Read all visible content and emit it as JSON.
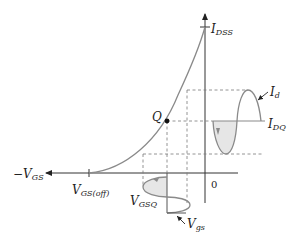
{
  "diagram": {
    "colors": {
      "axis": "#333333",
      "curve": "#8a8a8a",
      "dashed": "#7a7a7a",
      "fill": "#e6e6e6",
      "point": "#111111",
      "text": "#222222"
    },
    "labels": {
      "idss_main": "I",
      "idss_sub": "DSS",
      "neg_vgs_prefix": "−V",
      "neg_vgs_sub": "GS",
      "vgsoff_main": "V",
      "vgsoff_sub": "GS(off)",
      "origin": "0",
      "q_point": "Q",
      "id_main": "I",
      "id_sub": "d",
      "idq_main": "I",
      "idq_sub": "DQ",
      "vgsq_main": "V",
      "vgsq_sub": "GSQ",
      "vgs_main": "V",
      "vgs_sub": "gs"
    }
  }
}
